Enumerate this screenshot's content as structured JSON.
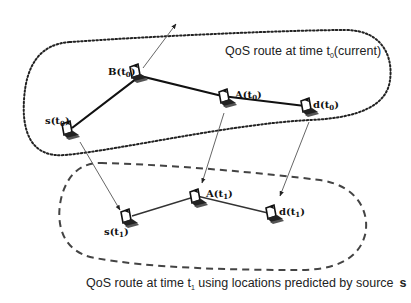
{
  "diagram": {
    "current_route_label": {
      "prefix": "QoS route at time t",
      "sub": "0",
      "suffix": "(current)"
    },
    "predicted_route_label": {
      "prefix": "QoS route at time t",
      "sub": "1",
      "suffix": " using locations predicted by source",
      "emph": "s"
    },
    "nodes_t0": [
      {
        "id": "s",
        "name": "s",
        "time": "0",
        "x": 68,
        "y": 132
      },
      {
        "id": "B",
        "name": "B",
        "time": "0",
        "x": 133,
        "y": 72
      },
      {
        "id": "A",
        "name": "A",
        "time": "0",
        "x": 225,
        "y": 97
      },
      {
        "id": "d",
        "name": "d",
        "time": "0",
        "x": 307,
        "y": 106
      }
    ],
    "nodes_t1": [
      {
        "id": "s",
        "name": "s",
        "time": "1",
        "x": 127,
        "y": 218
      },
      {
        "id": "A",
        "name": "A",
        "time": "1",
        "x": 195,
        "y": 198
      },
      {
        "id": "d",
        "name": "d",
        "time": "1",
        "x": 272,
        "y": 213
      }
    ],
    "route_t0": [
      "s(t0)",
      "B(t0)",
      "A(t0)",
      "d(t0)"
    ],
    "route_t1": [
      "s(t1)",
      "A(t1)",
      "d(t1)"
    ],
    "movement_arrows": [
      {
        "from": "B(t0)",
        "to": "out of range"
      },
      {
        "from": "s(t0)",
        "to": "s(t1)"
      },
      {
        "from": "A(t0)",
        "to": "A(t1)"
      },
      {
        "from": "d(t0)",
        "to": "d(t1)"
      }
    ]
  }
}
